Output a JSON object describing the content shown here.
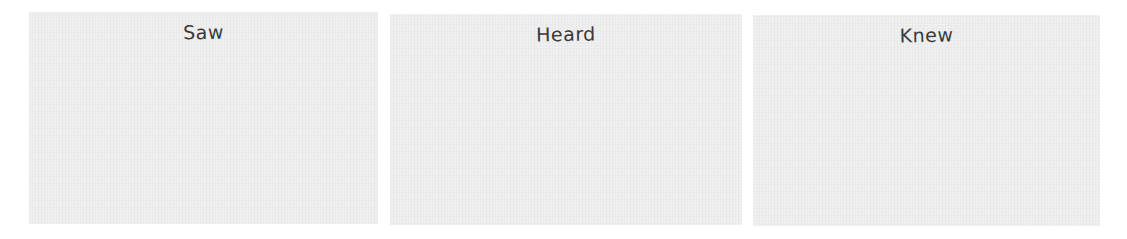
{
  "panels": [
    {
      "title": "Saw",
      "content": ""
    },
    {
      "title": "Heard",
      "content": ""
    },
    {
      "title": "Knew",
      "content": ""
    }
  ],
  "colors": {
    "panel_background": "#ededed",
    "title_text": "#3a3a3a",
    "page_background": "#ffffff"
  }
}
